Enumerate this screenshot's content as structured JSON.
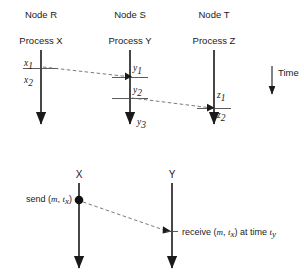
{
  "figure": {
    "background": "#ffffff",
    "ink": "#1a1a1a",
    "dash_color": "#6b6b6b"
  },
  "top_diagram": {
    "nodes": [
      {
        "node_label": "Node R",
        "process_label": "Process X",
        "x": 41
      },
      {
        "node_label": "Node S",
        "process_label": "Process Y",
        "x": 130
      },
      {
        "node_label": "Node T",
        "process_label": "Process Z",
        "x": 214
      }
    ],
    "events": [
      {
        "label": "x",
        "subscript": "1",
        "x": 28,
        "y": 65
      },
      {
        "label": "x",
        "subscript": "2",
        "x": 28,
        "y": 81
      },
      {
        "label": "y",
        "subscript": "1",
        "x": 135,
        "y": 70
      },
      {
        "label": "y",
        "subscript": "2",
        "x": 135,
        "y": 92
      },
      {
        "label": "y",
        "subscript": "3",
        "x": 138,
        "y": 123
      },
      {
        "label": "z",
        "subscript": "1",
        "x": 219,
        "y": 97
      },
      {
        "label": "z",
        "subscript": "2",
        "x": 219,
        "y": 115
      }
    ],
    "messages": [
      {
        "from": "x1",
        "to": "y1",
        "x1": 42,
        "y1": 67,
        "x2": 128,
        "y2": 77
      },
      {
        "from": "y2",
        "to": "z1",
        "x1": 131,
        "y1": 98,
        "x2": 211,
        "y2": 108
      }
    ],
    "time_axis": {
      "label": "Time",
      "x": 272,
      "y_start": 66,
      "y_end": 96
    }
  },
  "bottom_diagram": {
    "processes": [
      {
        "name": "X",
        "x": 79
      },
      {
        "name": "Y",
        "x": 172
      }
    ],
    "send_event": {
      "text": "send (",
      "m": "m",
      "comma": ", ",
      "t": "t",
      "t_sub": "x",
      "close": ")",
      "full_text": "send (m, tx)",
      "x": 79,
      "y": 199
    },
    "receive_event": {
      "prefix": "receive (",
      "m": "m",
      "comma": ", ",
      "t": "t",
      "t_sub": "x",
      "mid": ") at time ",
      "t2": "t",
      "t2_sub": "y",
      "full_text": "receive (m, tx) at time ty",
      "x": 172,
      "y": 234
    },
    "message": {
      "x1": 81,
      "y1": 201,
      "x2": 169,
      "y2": 232
    }
  }
}
